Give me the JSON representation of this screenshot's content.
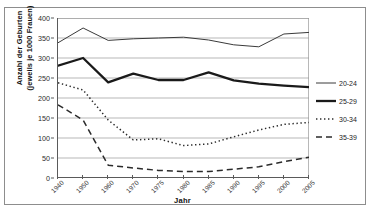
{
  "chart_data": {
    "type": "line",
    "title": "",
    "xlabel": "Jahr",
    "ylabel": "Anzahl der Geburten (jeweils je 1000 Frauen)",
    "ylabel_line1": "Anzahl der Geburten",
    "ylabel_line2": "(jeweils je 1000 Frauen)",
    "categories": [
      "1940",
      "1950",
      "1960",
      "1970",
      "1975",
      "1980",
      "1985",
      "1990",
      "1995",
      "2000",
      "2005"
    ],
    "ylim": [
      0,
      400
    ],
    "yticks": [
      0,
      50,
      100,
      150,
      200,
      250,
      300,
      350,
      400
    ],
    "ytick_labels": [
      "0",
      "50",
      "100",
      "150",
      "200",
      "250",
      "300",
      "350",
      "400"
    ],
    "grid": "horizontal",
    "legend_position": "right",
    "series": [
      {
        "name": "20-24",
        "style": "solid-thin",
        "color": "#3a3a3a",
        "values": [
          338,
          375,
          344,
          348,
          350,
          352,
          345,
          333,
          328,
          360,
          364
        ]
      },
      {
        "name": "25-29",
        "style": "solid-thick",
        "color": "#1a1a1a",
        "values": [
          281,
          300,
          239,
          261,
          245,
          245,
          264,
          244,
          236,
          231,
          227
        ]
      },
      {
        "name": "30-34",
        "style": "dotted",
        "color": "#2b2b2b",
        "values": [
          238,
          220,
          145,
          95,
          98,
          81,
          85,
          103,
          120,
          134,
          139
        ]
      },
      {
        "name": "35-39",
        "style": "dashed",
        "color": "#2b2b2b",
        "values": [
          183,
          145,
          32,
          25,
          19,
          16,
          16,
          22,
          28,
          41,
          52
        ]
      }
    ]
  },
  "legend": {
    "items": [
      {
        "label": "20-24"
      },
      {
        "label": "25-29"
      },
      {
        "label": "30-34"
      },
      {
        "label": "35-39"
      }
    ]
  }
}
